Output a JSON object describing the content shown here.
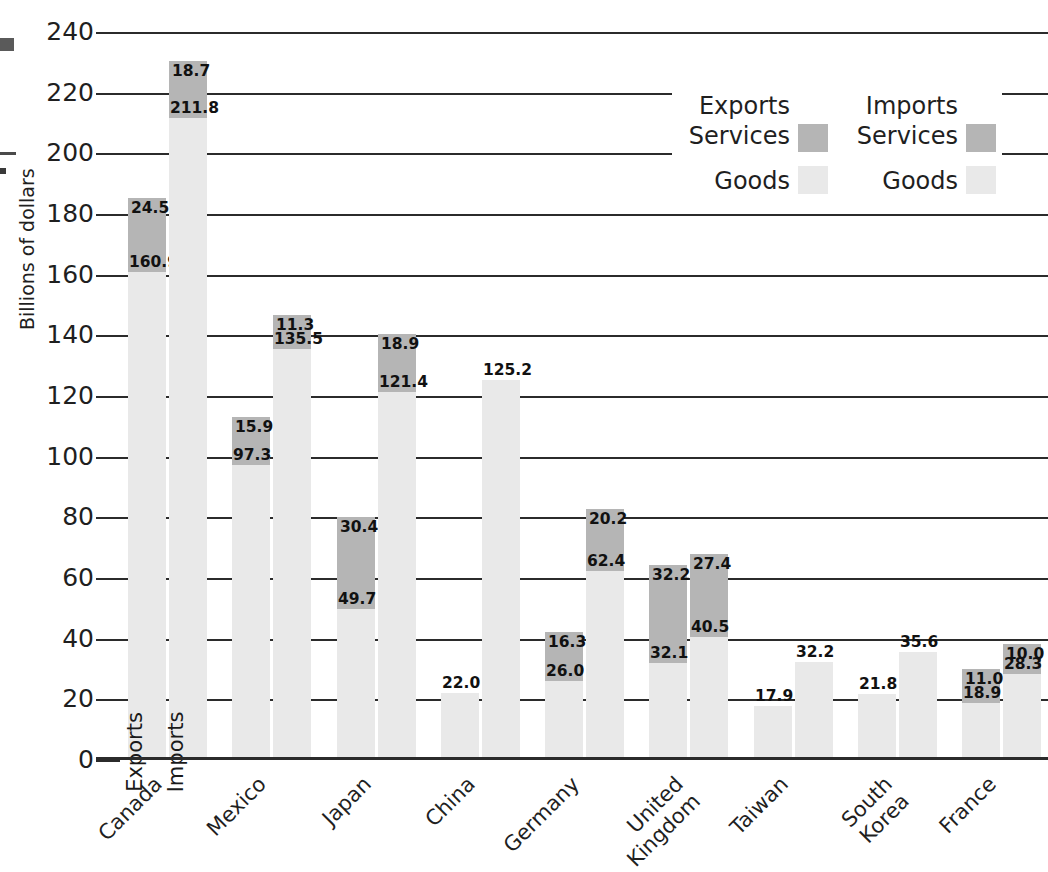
{
  "chart_data": {
    "type": "bar",
    "title": "",
    "subtitle": "",
    "xlabel": "",
    "ylabel": "Billions of dollars",
    "ylim": [
      0,
      240
    ],
    "ytick_step": 20,
    "yticks": [
      "0",
      "20",
      "40",
      "60",
      "80",
      "100",
      "120",
      "140",
      "160",
      "180",
      "200",
      "220",
      "240"
    ],
    "grid": true,
    "legend_position": "top-right",
    "stacked": true,
    "categories": [
      "Canada",
      "Mexico",
      "Japan",
      "China",
      "Germany",
      "United\nKingdom",
      "Taiwan",
      "South\nKorea",
      "France"
    ],
    "bar_group_labels": [
      "Exports",
      "Imports"
    ],
    "series": [
      {
        "name": "Exports Goods",
        "values": [
          160.9,
          97.3,
          49.7,
          22.0,
          26.0,
          32.1,
          17.9,
          21.8,
          18.9
        ]
      },
      {
        "name": "Exports Services",
        "values": [
          24.5,
          15.9,
          30.4,
          null,
          16.3,
          32.2,
          null,
          null,
          11.0
        ]
      },
      {
        "name": "Imports Goods",
        "values": [
          211.8,
          135.5,
          121.4,
          125.2,
          62.4,
          40.5,
          32.2,
          35.6,
          28.3
        ]
      },
      {
        "name": "Imports Services",
        "values": [
          18.7,
          11.3,
          18.9,
          null,
          20.2,
          27.4,
          null,
          null,
          10.0
        ]
      }
    ],
    "annotations": {
      "in_bar_exports": "Exports",
      "in_bar_imports": "Imports"
    }
  },
  "legend": {
    "exports": {
      "header": "Exports",
      "services_label": "Services",
      "goods_label": "Goods",
      "services_color": "#b5b5b5",
      "goods_color": "#e9e9e9"
    },
    "imports": {
      "header": "Imports",
      "services_label": "Services",
      "goods_label": "Goods",
      "services_color": "#b5b5b5",
      "goods_color": "#e9e9e9"
    }
  },
  "axis": {
    "y_title": "Billions of dollars",
    "y_labels": [
      "240",
      "220",
      "200",
      "180",
      "160",
      "140",
      "120",
      "100",
      "80",
      "60",
      "40",
      "20",
      "0"
    ]
  },
  "colors": {
    "goods": "#e9e9e9",
    "services": "#b5b5b5",
    "axis": "#2b2b2b",
    "text": "#1f1f1f",
    "background": "#ffffff"
  }
}
